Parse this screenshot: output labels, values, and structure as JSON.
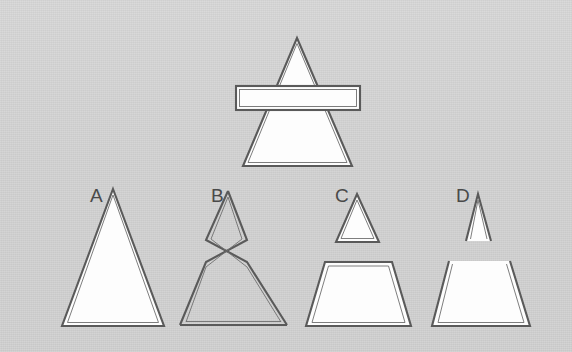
{
  "figure": {
    "background_color": "#d2d2d2",
    "stroke_color": "#5a5a5a",
    "fill_color": "#fdfdfd",
    "prompt": {
      "name": "triangle-with-horizontal-bar",
      "description": "A large outlined triangle overlaid by a horizontal rectangular bar crossing it",
      "shapes": [
        {
          "name": "main-triangle",
          "type": "triangle",
          "points": "297,38 352,166 243,166"
        },
        {
          "name": "horizontal-bar",
          "type": "rectangle",
          "points": "236,86 360,86 360,110 236,110"
        }
      ]
    },
    "options": [
      {
        "id": "A",
        "label": "A",
        "label_x": 90,
        "label_y": 202,
        "description": "single plain triangle, closed",
        "shapes": [
          {
            "name": "option-a-triangle",
            "type": "triangle-closed",
            "points": "113,189 164,326 62,326"
          }
        ]
      },
      {
        "id": "B",
        "label": "B",
        "label_x": 211,
        "label_y": 202,
        "description": "small triangle whose sides cross over and continue into a larger triangle, forming an X",
        "shapes": [
          {
            "name": "option-b-crossed-top",
            "type": "polyline-open",
            "points": "206,240 228,191 247,240"
          },
          {
            "name": "option-b-crossed-bottom",
            "type": "polyline-open",
            "points": "206,240 247,240 287,325 180,325 206,262 247,262"
          },
          {
            "name": "option-b-cross-path",
            "type": "polyline-open",
            "points": "228,191 206,262 180,325 287,325 247,262 228,191"
          }
        ]
      },
      {
        "id": "C",
        "label": "C",
        "label_x": 335,
        "label_y": 202,
        "description": "small closed triangle above a separated closed trapezoid",
        "shapes": [
          {
            "name": "option-c-small-triangle",
            "type": "triangle-closed",
            "points": "357,194 379,242 336,242"
          },
          {
            "name": "option-c-trapezoid",
            "type": "trapezoid-closed",
            "points": "325,262 392,262 411,326 306,326"
          }
        ]
      },
      {
        "id": "D",
        "label": "D",
        "label_x": 456,
        "label_y": 202,
        "description": "small open-bottom triangle above a separated open-top trapezoid",
        "shapes": [
          {
            "name": "option-d-small-triangle-open",
            "type": "polyline-open",
            "points": "466,241 478,194 491,241"
          },
          {
            "name": "option-d-trapezoid-open",
            "type": "polyline-open",
            "points": "449,261 432,326 530,326 510,261"
          }
        ]
      }
    ]
  }
}
